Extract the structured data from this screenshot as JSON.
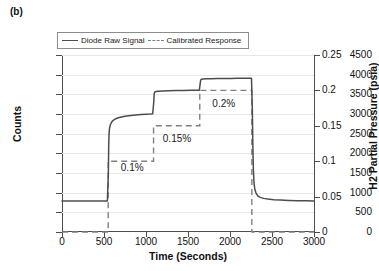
{
  "panel_label": "(b)",
  "legend": {
    "position": "top-left-inside",
    "entries": [
      {
        "label": "Diode Raw Signal",
        "style": "solid",
        "color": "#4d4d4d",
        "icon": "solid-line-icon"
      },
      {
        "label": "Calibrated Response",
        "style": "dashed",
        "color": "#808080",
        "icon": "dashed-line-icon"
      }
    ]
  },
  "chart_data": {
    "type": "line",
    "title": "",
    "xlabel": "Time (Seconds)",
    "ylabel": "Counts",
    "y2label": "H2 Partial Pressure (psia)",
    "xlim": [
      0,
      3000
    ],
    "ylim": [
      0,
      4500
    ],
    "y2lim": [
      0,
      0.25
    ],
    "grid": true,
    "xticks": [
      0,
      500,
      1000,
      1500,
      2000,
      2500,
      3000
    ],
    "xticklabels": [
      "0",
      "500",
      "1000",
      "1500",
      "2000",
      "2500",
      "3000"
    ],
    "yticks": [
      0,
      500,
      1000,
      1500,
      2000,
      2500,
      3000,
      3500,
      4000,
      4500
    ],
    "yticklabels": [
      "0",
      "500",
      "1000",
      "1500",
      "2000",
      "2500",
      "3000",
      "3500",
      "4000",
      "4500"
    ],
    "y2ticks": [
      0,
      0.05,
      0.1,
      0.15,
      0.2,
      0.25
    ],
    "y2ticklabels": [
      "0",
      "0.05",
      "0.1",
      "0.15",
      "0.2",
      "0.25"
    ],
    "annotations": [
      {
        "text": "0.1%",
        "x": 700,
        "y": 1620
      },
      {
        "text": "0.15%",
        "x": 1200,
        "y": 2360
      },
      {
        "text": "0.2%",
        "x": 1790,
        "y": 3250
      }
    ],
    "series": [
      {
        "name": "Diode Raw Signal",
        "axis": "left",
        "style": "solid",
        "color": "#4d4d4d",
        "description": "Baseline ~790 counts until 550 s, sharp rise with exponential approach to ~3010 counts, step at 1090 s to ~3600 counts, step at 1640 s to ~3900 counts, sharp decay at 2260 s back to ~790 counts.",
        "points": [
          [
            0,
            790
          ],
          [
            100,
            788
          ],
          [
            200,
            790
          ],
          [
            300,
            788
          ],
          [
            400,
            790
          ],
          [
            500,
            788
          ],
          [
            540,
            786
          ],
          [
            552,
            1500
          ],
          [
            556,
            2200
          ],
          [
            560,
            2500
          ],
          [
            566,
            2640
          ],
          [
            575,
            2720
          ],
          [
            590,
            2790
          ],
          [
            610,
            2840
          ],
          [
            640,
            2880
          ],
          [
            680,
            2910
          ],
          [
            720,
            2930
          ],
          [
            770,
            2950
          ],
          [
            820,
            2962
          ],
          [
            880,
            2975
          ],
          [
            940,
            2985
          ],
          [
            1000,
            2995
          ],
          [
            1050,
            3002
          ],
          [
            1080,
            3008
          ],
          [
            1092,
            3300
          ],
          [
            1098,
            3520
          ],
          [
            1105,
            3560
          ],
          [
            1120,
            3572
          ],
          [
            1150,
            3580
          ],
          [
            1200,
            3586
          ],
          [
            1270,
            3592
          ],
          [
            1350,
            3596
          ],
          [
            1440,
            3600
          ],
          [
            1530,
            3602
          ],
          [
            1610,
            3604
          ],
          [
            1635,
            3606
          ],
          [
            1646,
            3790
          ],
          [
            1652,
            3870
          ],
          [
            1662,
            3884
          ],
          [
            1680,
            3890
          ],
          [
            1720,
            3894
          ],
          [
            1780,
            3898
          ],
          [
            1850,
            3900
          ],
          [
            1930,
            3902
          ],
          [
            2010,
            3904
          ],
          [
            2090,
            3906
          ],
          [
            2170,
            3908
          ],
          [
            2240,
            3908
          ],
          [
            2256,
            3906
          ],
          [
            2266,
            3100
          ],
          [
            2272,
            2200
          ],
          [
            2278,
            1600
          ],
          [
            2286,
            1250
          ],
          [
            2296,
            1080
          ],
          [
            2310,
            990
          ],
          [
            2330,
            920
          ],
          [
            2360,
            880
          ],
          [
            2400,
            855
          ],
          [
            2450,
            838
          ],
          [
            2520,
            822
          ],
          [
            2600,
            812
          ],
          [
            2700,
            802
          ],
          [
            2800,
            796
          ],
          [
            2900,
            792
          ],
          [
            3000,
            790
          ]
        ]
      },
      {
        "name": "Calibrated Response",
        "axis": "right",
        "style": "dashed",
        "color": "#808080",
        "description": "Step function: 0 psia until 550 s, 0.1 psia (0.1%) from 550 to 1090 s, 0.15 psia (0.15%) from 1090 to 1640 s, 0.2 psia (0.2%) from 1640 to 2260 s, then 0 psia.",
        "points": [
          [
            0,
            0
          ],
          [
            550,
            0
          ],
          [
            550,
            0.1
          ],
          [
            1090,
            0.1
          ],
          [
            1090,
            0.15
          ],
          [
            1640,
            0.15
          ],
          [
            1640,
            0.2
          ],
          [
            2260,
            0.2
          ],
          [
            2260,
            0
          ],
          [
            3000,
            0
          ]
        ]
      }
    ]
  }
}
